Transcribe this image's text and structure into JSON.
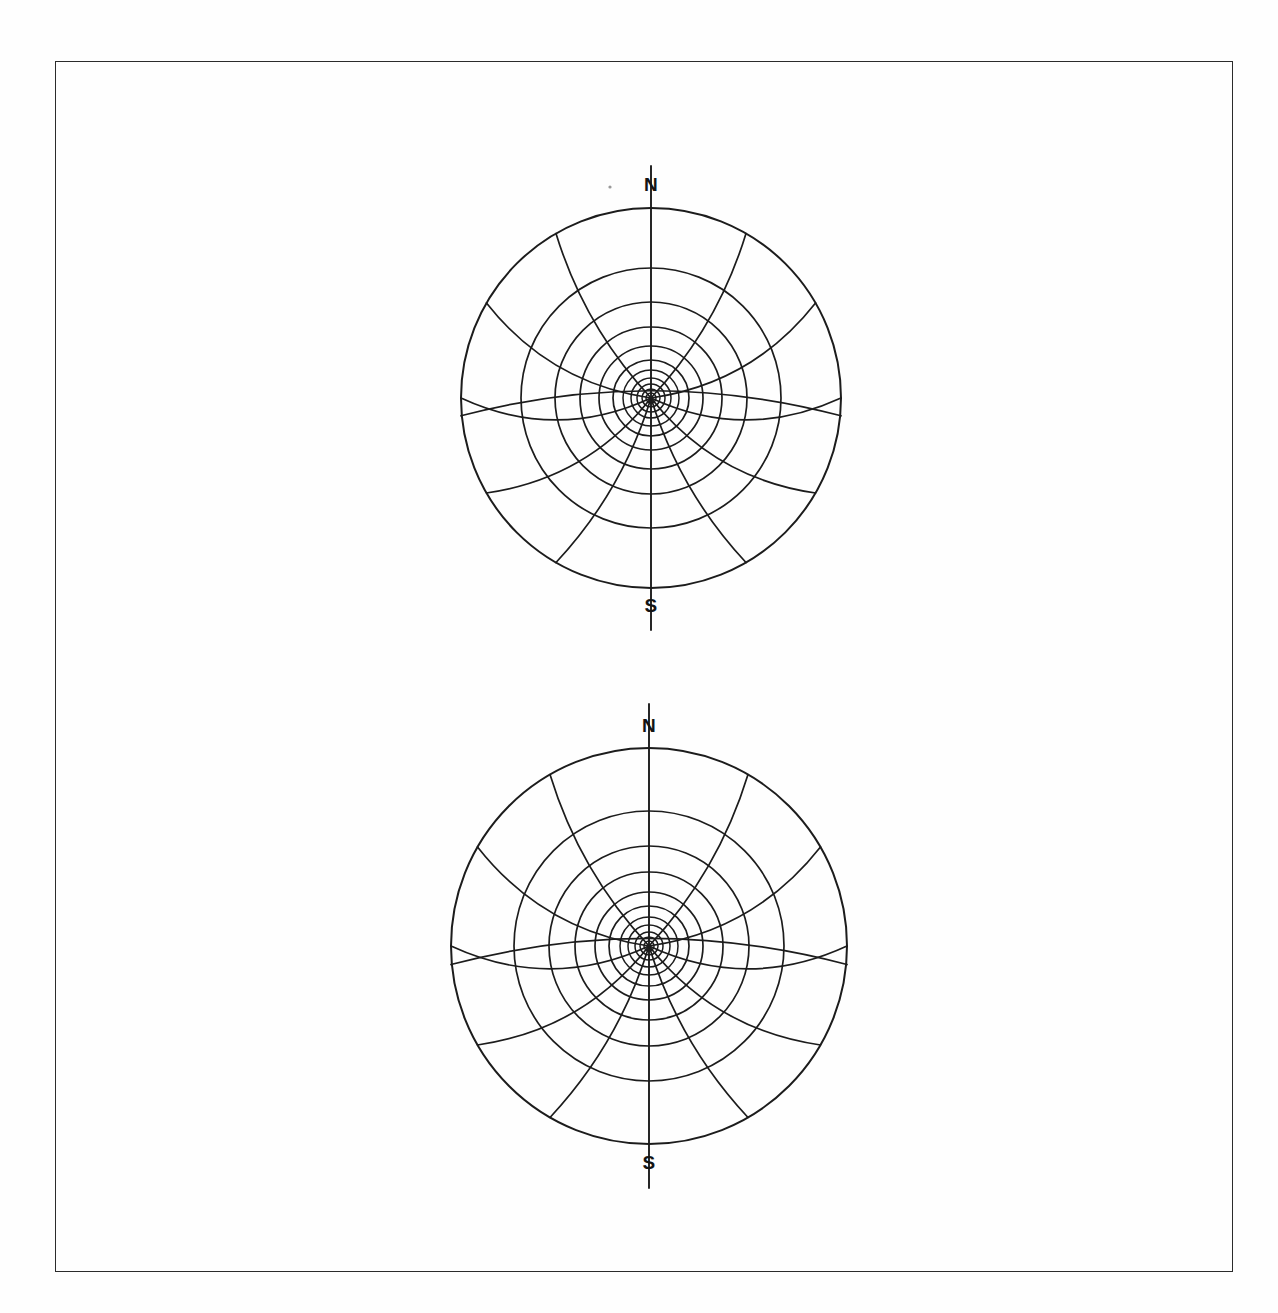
{
  "page": {
    "background_color": "#ffffff",
    "border_color": "#2b2b2b",
    "ink_color": "#1c1c1c",
    "border": {
      "x": 55,
      "y": 61,
      "width": 1178,
      "height": 1211
    }
  },
  "figures": [
    {
      "id": "figure-top",
      "name": "polar-projection-diagram-top",
      "north_label": "N",
      "south_label": "S",
      "center": {
        "x": 211,
        "y": 233
      },
      "outer_radius": 190
    },
    {
      "id": "figure-bottom",
      "name": "polar-projection-diagram-bottom",
      "north_label": "N",
      "south_label": "S",
      "center": {
        "x": 217,
        "y": 240
      },
      "outer_radius": 198
    }
  ],
  "chart_data": {
    "type": "line",
    "title": "",
    "subtitle": "",
    "xlabel": "",
    "ylabel": "",
    "projection": "polar-stereographic",
    "panels": [
      {
        "name": "upper-polar-grid",
        "center_px": [
          211,
          233
        ],
        "outer_radius_px": 190,
        "parallel_radii_px": [
          5,
          9,
          14,
          20,
          28,
          38,
          52,
          71,
          96,
          130,
          190
        ],
        "parallel_count": 11,
        "meridian_longitudes_deg": [
          0,
          30,
          60,
          90,
          120,
          150,
          180,
          210,
          240,
          270,
          300,
          330
        ],
        "meridian_count": 12,
        "meridian_curvature": 0.42,
        "axis_labels": {
          "top": "N",
          "bottom": "S"
        },
        "axis_overshoot_px": 42,
        "grid": true,
        "legend": "none"
      },
      {
        "name": "lower-polar-grid",
        "center_px": [
          217,
          240
        ],
        "outer_radius_px": 198,
        "parallel_radii_px": [
          5,
          9,
          14,
          21,
          29,
          40,
          54,
          74,
          100,
          135,
          198
        ],
        "parallel_count": 11,
        "meridian_longitudes_deg": [
          0,
          30,
          60,
          90,
          120,
          150,
          180,
          210,
          240,
          270,
          300,
          330
        ],
        "meridian_count": 12,
        "meridian_curvature": 0.42,
        "axis_labels": {
          "top": "N",
          "bottom": "S"
        },
        "axis_overshoot_px": 44,
        "grid": true,
        "legend": "none"
      }
    ]
  }
}
